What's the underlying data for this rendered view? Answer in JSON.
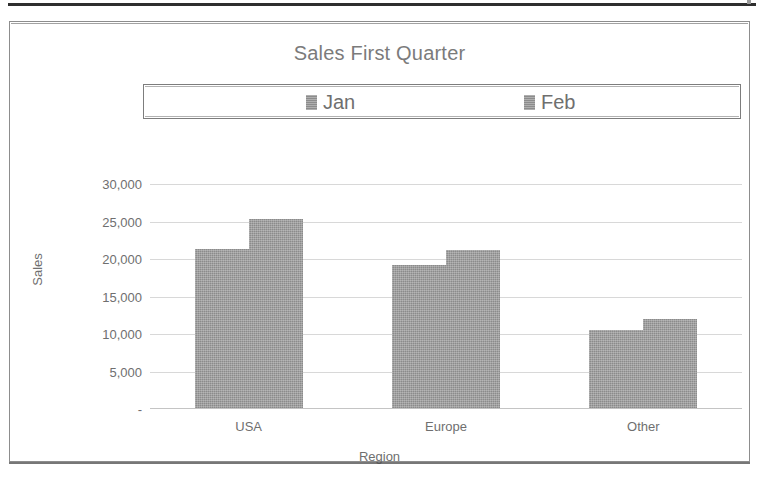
{
  "page": {
    "background_color": "#ffffff",
    "rule_color": "#2e2e2e"
  },
  "chart": {
    "title": "Sales First Quarter",
    "frame_border_color": "#8d8d8d",
    "series_color": "#8b8b8b",
    "gridline_color": "#d8d8d8",
    "text_color": "#6f6f6f"
  },
  "legend": {
    "position": "top",
    "entries": [
      {
        "label": "Jan",
        "color": "#8c8c8c"
      },
      {
        "label": "Feb",
        "color": "#8c8c8c"
      }
    ]
  },
  "axes": {
    "y_title": "Sales",
    "x_title": "Region",
    "y_ticks": [
      "30,000",
      "25,000",
      "20,000",
      "15,000",
      "10,000",
      "5,000",
      "-"
    ],
    "x_categories": [
      "USA",
      "Europe",
      "Other"
    ]
  },
  "chart_data": {
    "type": "bar",
    "title": "Sales First Quarter",
    "xlabel": "Region",
    "ylabel": "Sales",
    "categories": [
      "USA",
      "Europe",
      "Other"
    ],
    "series": [
      {
        "name": "Jan",
        "values": [
          21400,
          19200,
          10600
        ]
      },
      {
        "name": "Feb",
        "values": [
          25300,
          21200,
          12000
        ]
      }
    ],
    "ylim": [
      0,
      30000
    ],
    "ytick_values": [
      0,
      5000,
      10000,
      15000,
      20000,
      25000,
      30000
    ],
    "ytick_labels": [
      "-",
      "5,000",
      "10,000",
      "15,000",
      "20,000",
      "25,000",
      "30,000"
    ],
    "grid": true,
    "grid_axis": "y",
    "legend_position": "top",
    "bar_gap_within_group": 0
  }
}
